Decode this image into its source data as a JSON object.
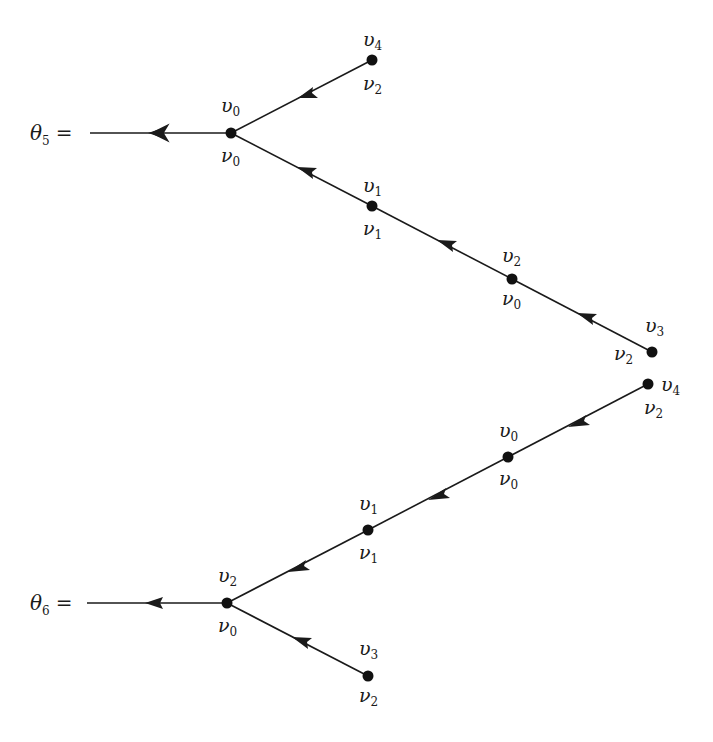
{
  "diagram": {
    "type": "tree-diagrams",
    "trees": [
      {
        "name": "theta5",
        "label": {
          "sym": "θ",
          "sub": "5",
          "eq": "="
        },
        "root": {
          "x": 231,
          "y": 133,
          "top": {
            "sym": "υ",
            "sub": "0"
          },
          "bottom": {
            "sym": "ν",
            "sub": "0"
          }
        },
        "stem_start": {
          "x": 90,
          "y": 133
        },
        "nodes": [
          {
            "id": "v4",
            "x": 372,
            "y": 60,
            "top": {
              "sym": "υ",
              "sub": "4"
            },
            "bottom": {
              "sym": "ν",
              "sub": "2"
            }
          },
          {
            "id": "v1",
            "x": 372,
            "y": 206,
            "top": {
              "sym": "υ",
              "sub": "1"
            },
            "bottom": {
              "sym": "ν",
              "sub": "1"
            }
          },
          {
            "id": "v2",
            "x": 512,
            "y": 279,
            "top": {
              "sym": "υ",
              "sub": "2"
            },
            "bottom": {
              "sym": "ν",
              "sub": "0"
            }
          },
          {
            "id": "v3",
            "x": 652,
            "y": 352,
            "top": {
              "sym": "υ",
              "sub": "3"
            },
            "bottom": {
              "sym": "ν",
              "sub": "2"
            }
          }
        ]
      },
      {
        "name": "theta6",
        "label": {
          "sym": "θ",
          "sub": "6",
          "eq": "="
        },
        "root": {
          "x": 227,
          "y": 603,
          "top": {
            "sym": "υ",
            "sub": "2"
          },
          "bottom": {
            "sym": "ν",
            "sub": "0"
          }
        },
        "stem_start": {
          "x": 87,
          "y": 603
        },
        "nodes": [
          {
            "id": "v4",
            "x": 648,
            "y": 384,
            "top": {
              "sym": "υ",
              "sub": "4"
            },
            "bottom": {
              "sym": "ν",
              "sub": "2"
            }
          },
          {
            "id": "v0",
            "x": 508,
            "y": 457,
            "top": {
              "sym": "υ",
              "sub": "0"
            },
            "bottom": {
              "sym": "ν",
              "sub": "0"
            }
          },
          {
            "id": "v1",
            "x": 368,
            "y": 530,
            "top": {
              "sym": "υ",
              "sub": "1"
            },
            "bottom": {
              "sym": "ν",
              "sub": "1"
            }
          },
          {
            "id": "v3",
            "x": 368,
            "y": 676,
            "top": {
              "sym": "υ",
              "sub": "3"
            },
            "bottom": {
              "sym": "ν",
              "sub": "2"
            }
          }
        ]
      }
    ],
    "colors": {
      "ink": "#1a1a1a",
      "background": "#ffffff"
    }
  }
}
